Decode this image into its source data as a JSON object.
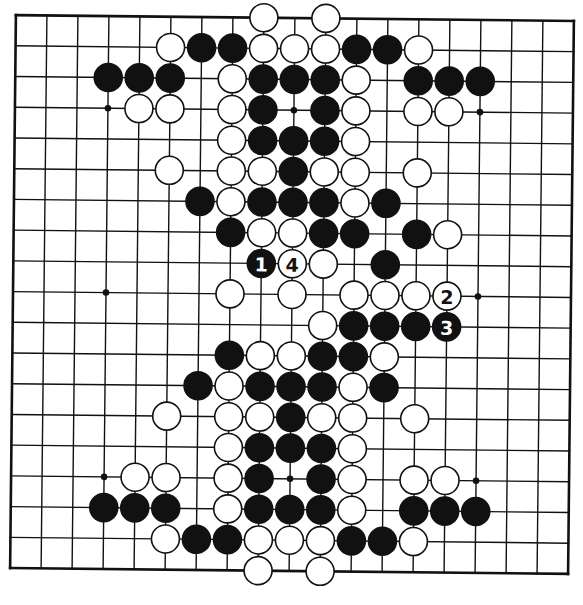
{
  "diagram": {
    "type": "go-board",
    "size": 19,
    "colors": {
      "paper": "#ffffff",
      "line": "#111111",
      "black_stone": "#111111",
      "white_stone_fill": "#ffffff",
      "white_stone_stroke": "#111111"
    },
    "hoshi": [
      [
        3,
        3
      ],
      [
        3,
        9
      ],
      [
        3,
        15
      ],
      [
        9,
        3
      ],
      [
        9,
        9
      ],
      [
        9,
        15
      ],
      [
        15,
        3
      ],
      [
        15,
        9
      ],
      [
        15,
        15
      ]
    ],
    "stones": {
      "black": [
        [
          1,
          6
        ],
        [
          1,
          7
        ],
        [
          1,
          11
        ],
        [
          1,
          12
        ],
        [
          2,
          3
        ],
        [
          2,
          4
        ],
        [
          2,
          5
        ],
        [
          2,
          8
        ],
        [
          2,
          9
        ],
        [
          2,
          10
        ],
        [
          2,
          13
        ],
        [
          2,
          14
        ],
        [
          2,
          15
        ],
        [
          3,
          8
        ],
        [
          3,
          10
        ],
        [
          4,
          8
        ],
        [
          4,
          9
        ],
        [
          4,
          10
        ],
        [
          5,
          9
        ],
        [
          6,
          6
        ],
        [
          6,
          8
        ],
        [
          6,
          9
        ],
        [
          6,
          10
        ],
        [
          6,
          12
        ],
        [
          7,
          7
        ],
        [
          7,
          10
        ],
        [
          7,
          11
        ],
        [
          7,
          13
        ],
        [
          8,
          12
        ],
        [
          10,
          11
        ],
        [
          10,
          12
        ],
        [
          10,
          13
        ],
        [
          11,
          7
        ],
        [
          11,
          10
        ],
        [
          11,
          11
        ],
        [
          12,
          6
        ],
        [
          12,
          8
        ],
        [
          12,
          9
        ],
        [
          12,
          10
        ],
        [
          12,
          12
        ],
        [
          13,
          9
        ],
        [
          14,
          8
        ],
        [
          14,
          9
        ],
        [
          14,
          10
        ],
        [
          15,
          8
        ],
        [
          15,
          10
        ],
        [
          16,
          3
        ],
        [
          16,
          4
        ],
        [
          16,
          5
        ],
        [
          16,
          8
        ],
        [
          16,
          9
        ],
        [
          16,
          10
        ],
        [
          16,
          13
        ],
        [
          16,
          14
        ],
        [
          16,
          15
        ],
        [
          17,
          6
        ],
        [
          17,
          7
        ],
        [
          17,
          11
        ],
        [
          17,
          12
        ]
      ],
      "white": [
        [
          0,
          8
        ],
        [
          0,
          10
        ],
        [
          1,
          5
        ],
        [
          1,
          8
        ],
        [
          1,
          9
        ],
        [
          1,
          10
        ],
        [
          1,
          13
        ],
        [
          2,
          7
        ],
        [
          2,
          11
        ],
        [
          3,
          4
        ],
        [
          3,
          5
        ],
        [
          3,
          7
        ],
        [
          3,
          11
        ],
        [
          3,
          13
        ],
        [
          3,
          14
        ],
        [
          4,
          7
        ],
        [
          4,
          11
        ],
        [
          5,
          5
        ],
        [
          5,
          7
        ],
        [
          5,
          8
        ],
        [
          5,
          10
        ],
        [
          5,
          11
        ],
        [
          5,
          13
        ],
        [
          6,
          7
        ],
        [
          6,
          11
        ],
        [
          7,
          8
        ],
        [
          7,
          9
        ],
        [
          7,
          14
        ],
        [
          8,
          10
        ],
        [
          9,
          7
        ],
        [
          9,
          9
        ],
        [
          9,
          11
        ],
        [
          9,
          12
        ],
        [
          9,
          13
        ],
        [
          10,
          10
        ],
        [
          11,
          8
        ],
        [
          11,
          9
        ],
        [
          11,
          12
        ],
        [
          12,
          7
        ],
        [
          12,
          11
        ],
        [
          13,
          5
        ],
        [
          13,
          7
        ],
        [
          13,
          8
        ],
        [
          13,
          10
        ],
        [
          13,
          11
        ],
        [
          13,
          13
        ],
        [
          14,
          7
        ],
        [
          14,
          11
        ],
        [
          15,
          4
        ],
        [
          15,
          5
        ],
        [
          15,
          7
        ],
        [
          15,
          11
        ],
        [
          15,
          13
        ],
        [
          15,
          14
        ],
        [
          16,
          7
        ],
        [
          16,
          11
        ],
        [
          17,
          5
        ],
        [
          17,
          8
        ],
        [
          17,
          9
        ],
        [
          17,
          10
        ],
        [
          17,
          13
        ],
        [
          18,
          8
        ],
        [
          18,
          10
        ]
      ]
    },
    "numbered_moves": [
      {
        "number": "1",
        "color": "black",
        "row": 8,
        "col": 8
      },
      {
        "number": "2",
        "color": "white",
        "row": 9,
        "col": 14
      },
      {
        "number": "3",
        "color": "black",
        "row": 10,
        "col": 14
      },
      {
        "number": "4",
        "color": "white",
        "row": 8,
        "col": 9
      }
    ]
  }
}
